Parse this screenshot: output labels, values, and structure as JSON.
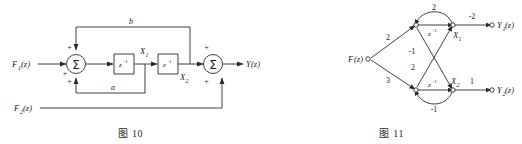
{
  "page": {
    "background": "#ffffff",
    "line_color": "#2a2a2a",
    "text_color": "#1a1a1a"
  },
  "figures": [
    {
      "id": "fig-10",
      "caption_prefix": "图",
      "caption_number": "10",
      "caption": "图 10",
      "type": "block-diagram",
      "inputs": [
        {
          "name": "F1",
          "label": "F",
          "sub": "1",
          "suffix": "(z)"
        },
        {
          "name": "F2",
          "label": "F",
          "sub": "2",
          "suffix": "(z)"
        }
      ],
      "outputs": [
        {
          "name": "Y",
          "label": "Y",
          "sub": "",
          "suffix": "(z)"
        }
      ],
      "blocks": [
        {
          "name": "delay-1",
          "label": "z",
          "exp": "-1"
        },
        {
          "name": "delay-2",
          "label": "z",
          "exp": "-1"
        }
      ],
      "summers": [
        {
          "name": "summer-1",
          "glyph": "Σ",
          "signs": [
            "+",
            "+",
            "+"
          ]
        },
        {
          "name": "summer-2",
          "glyph": "Σ",
          "signs": [
            "+",
            "+"
          ]
        }
      ],
      "state_labels": [
        {
          "name": "X1",
          "label": "X",
          "sub": "1"
        },
        {
          "name": "X2",
          "label": "X",
          "sub": "2"
        }
      ],
      "gains": [
        {
          "name": "gain-b",
          "label": "b"
        },
        {
          "name": "gain-a",
          "label": "a"
        }
      ]
    },
    {
      "id": "fig-11",
      "caption_prefix": "图",
      "caption_number": "11",
      "caption": "图 11",
      "type": "signal-flow-graph",
      "inputs": [
        {
          "name": "F",
          "label": "F",
          "sub": "",
          "suffix": "(z)"
        }
      ],
      "outputs": [
        {
          "name": "Y1",
          "label": "Y",
          "sub": "1",
          "suffix": "(z)"
        },
        {
          "name": "Y2",
          "label": "Y",
          "sub": "2",
          "suffix": "(z)"
        }
      ],
      "state_labels": [
        {
          "name": "X1",
          "label": "X",
          "sub": "1"
        },
        {
          "name": "X2",
          "label": "X",
          "sub": "2"
        }
      ],
      "branch_gains": [
        {
          "name": "branch-f-to-top",
          "label": "2"
        },
        {
          "name": "branch-f-to-bottom",
          "label": "3"
        },
        {
          "name": "branch-top-selfloop",
          "label": "2"
        },
        {
          "name": "branch-cross-down",
          "label": "-1"
        },
        {
          "name": "branch-cross-up",
          "label": "2"
        },
        {
          "name": "branch-bottom-loop",
          "label": "-1"
        },
        {
          "name": "branch-out-top",
          "label": "-2"
        },
        {
          "name": "branch-out-bottom",
          "label": "1"
        }
      ],
      "delays": [
        {
          "name": "delay-top",
          "label": "z",
          "exp": "-1"
        },
        {
          "name": "delay-bottom",
          "label": "z",
          "exp": "-1"
        }
      ]
    }
  ]
}
